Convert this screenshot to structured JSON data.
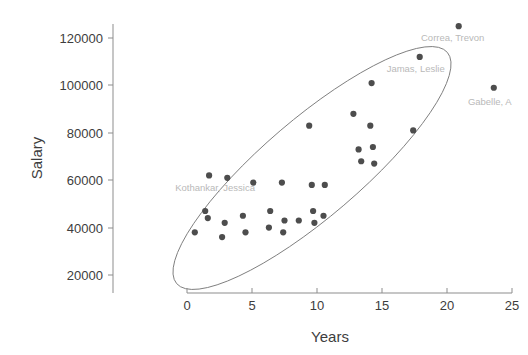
{
  "chart_data": {
    "type": "scatter",
    "title": "",
    "xlabel": "Years",
    "ylabel": "Salary",
    "xlim": [
      -4.2,
      26.0
    ],
    "ylim": [
      5000,
      131000
    ],
    "grid": false,
    "legend": null,
    "xticks": [
      0,
      5,
      10,
      15,
      20,
      25
    ],
    "xtick_labels": [
      "0",
      "5",
      "10",
      "15",
      "20",
      "25"
    ],
    "yticks": [
      20000,
      40000,
      60000,
      80000,
      100000,
      120000
    ],
    "ytick_labels": [
      "20000",
      "40000",
      "60000",
      "80000",
      "100000",
      "120000"
    ],
    "marker_color": "#4d4d4d",
    "ellipse_color": "#7c7c7c",
    "points": [
      {
        "x": 1.7,
        "y": 62000
      },
      {
        "x": 1.4,
        "y": 47000
      },
      {
        "x": 1.6,
        "y": 44000
      },
      {
        "x": 0.6,
        "y": 38000
      },
      {
        "x": 3.1,
        "y": 61000
      },
      {
        "x": 2.9,
        "y": 42000
      },
      {
        "x": 2.7,
        "y": 36000
      },
      {
        "x": 4.3,
        "y": 45000
      },
      {
        "x": 5.1,
        "y": 59000
      },
      {
        "x": 4.5,
        "y": 38000
      },
      {
        "x": 6.4,
        "y": 47000
      },
      {
        "x": 6.3,
        "y": 40000
      },
      {
        "x": 7.3,
        "y": 59000
      },
      {
        "x": 7.5,
        "y": 43000
      },
      {
        "x": 7.4,
        "y": 38000
      },
      {
        "x": 8.6,
        "y": 43000
      },
      {
        "x": 9.4,
        "y": 83000
      },
      {
        "x": 9.6,
        "y": 58000
      },
      {
        "x": 9.7,
        "y": 47000
      },
      {
        "x": 9.8,
        "y": 42000
      },
      {
        "x": 10.6,
        "y": 58000
      },
      {
        "x": 10.5,
        "y": 45000
      },
      {
        "x": 12.8,
        "y": 88000
      },
      {
        "x": 13.2,
        "y": 73000
      },
      {
        "x": 13.4,
        "y": 68000
      },
      {
        "x": 14.2,
        "y": 101000
      },
      {
        "x": 14.1,
        "y": 83000
      },
      {
        "x": 14.3,
        "y": 74000
      },
      {
        "x": 14.4,
        "y": 67000
      },
      {
        "x": 17.4,
        "y": 81000
      },
      {
        "x": 17.9,
        "y": 112000
      },
      {
        "x": 20.9,
        "y": 125000
      },
      {
        "x": 23.6,
        "y": 99000
      }
    ],
    "annotations": [
      {
        "label": "Correa, Trevon",
        "x": 20.9,
        "y": 125000
      },
      {
        "label": "Jamas, Leslie",
        "x": 17.9,
        "y": 112000
      },
      {
        "label": "Gabelle, A",
        "x": 23.6,
        "y": 99000
      },
      {
        "label": "Kothankar, Jessica",
        "x": 1.7,
        "y": 62000
      }
    ],
    "confidence_ellipse": {
      "center_x": 9.6,
      "center_y": 63500,
      "width": 27.5,
      "height": 7.6,
      "angle_deg": -40.5,
      "description": "tilted confidence ellipse enclosing the point cloud"
    }
  }
}
